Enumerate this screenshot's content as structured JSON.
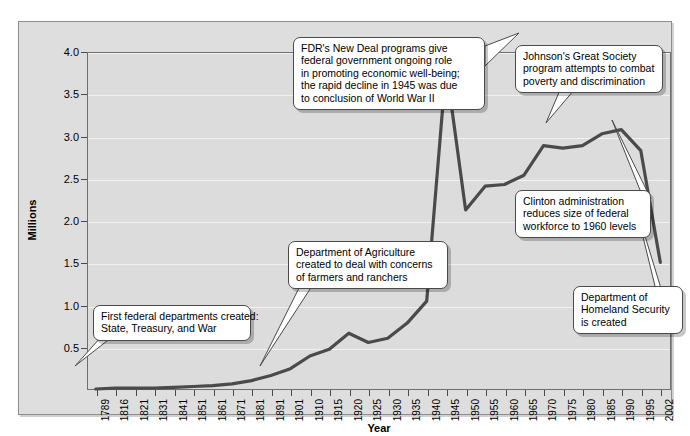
{
  "chart_data": {
    "type": "line",
    "title": "",
    "xlabel": "Year",
    "ylabel": "Millions",
    "ylim": [
      0,
      4.0
    ],
    "yticks": [
      "0.5",
      "1.0",
      "1.5",
      "2.0",
      "2.5",
      "3.0",
      "3.5",
      "4.0"
    ],
    "ytick_values": [
      0.5,
      1.0,
      1.5,
      2.0,
      2.5,
      3.0,
      3.5,
      4.0
    ],
    "grid": "horizontal",
    "legend": "none",
    "line_color": "#4a4a4a",
    "plot_bg": "#dcdcdc",
    "frame_bg": "#dedede",
    "categories": [
      "1789",
      "1816",
      "1821",
      "1831",
      "1841",
      "1851",
      "1861",
      "1871",
      "1881",
      "1891",
      "1901",
      "1910",
      "1915",
      "1920",
      "1925",
      "1930",
      "1935",
      "1940",
      "1945",
      "1950",
      "1955",
      "1960",
      "1965",
      "1970",
      "1975",
      "1980",
      "1985",
      "1990",
      "1995",
      "2002"
    ],
    "values": [
      0.0,
      0.01,
      0.01,
      0.01,
      0.02,
      0.03,
      0.04,
      0.06,
      0.1,
      0.16,
      0.24,
      0.39,
      0.47,
      0.66,
      0.55,
      0.6,
      0.78,
      1.04,
      3.82,
      2.12,
      2.4,
      2.42,
      2.53,
      2.88,
      2.85,
      2.88,
      3.02,
      3.07,
      2.82,
      1.5
    ],
    "annotations": [
      {
        "name": "first-federal-departments",
        "lines": [
          "First federal departments created:",
          "State, Treasury, and War"
        ],
        "target_category": "1789"
      },
      {
        "name": "department-of-agriculture",
        "lines": [
          "Department of Agriculture",
          "created to deal with concerns",
          "of farmers and ranchers"
        ],
        "target_category": "1865"
      },
      {
        "name": "fdr-new-deal",
        "lines": [
          "FDR's New Deal programs give",
          "federal government ongoing role",
          "in promoting economic well-being;",
          "the rapid decline in 1945 was due",
          "to conclusion of World War II"
        ],
        "target_category": "1945"
      },
      {
        "name": "johnson-great-society",
        "lines": [
          "Johnson's Great Society",
          "program attempts to combat",
          "poverty and discrimination"
        ],
        "target_category": "1965"
      },
      {
        "name": "clinton-administration",
        "lines": [
          "Clinton administration",
          "reduces size of federal",
          "workforce to 1960 levels"
        ],
        "target_category": "1993"
      },
      {
        "name": "homeland-security",
        "lines": [
          "Department of",
          "Homeland Security",
          "is created"
        ],
        "target_category": "2002"
      }
    ]
  }
}
